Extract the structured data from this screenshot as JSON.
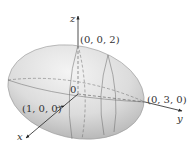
{
  "diagram": {
    "type": "ellipsoid",
    "equation_semi_axes": {
      "a": 1,
      "b": 3,
      "c": 2
    },
    "axes": {
      "x": {
        "label": "x"
      },
      "y": {
        "label": "y"
      },
      "z": {
        "label": "z"
      }
    },
    "points": [
      {
        "label": "(0, 0, 2)",
        "role": "z-intercept"
      },
      {
        "label": "(1, 0, 0)",
        "role": "x-intercept"
      },
      {
        "label": "(0, 3, 0)",
        "role": "y-intercept"
      },
      {
        "label": "0",
        "role": "origin"
      }
    ],
    "colors": {
      "surface_light": "#f2f2f2",
      "surface_dark": "#b8b8b8",
      "line": "#555555",
      "axis": "#222222"
    }
  }
}
